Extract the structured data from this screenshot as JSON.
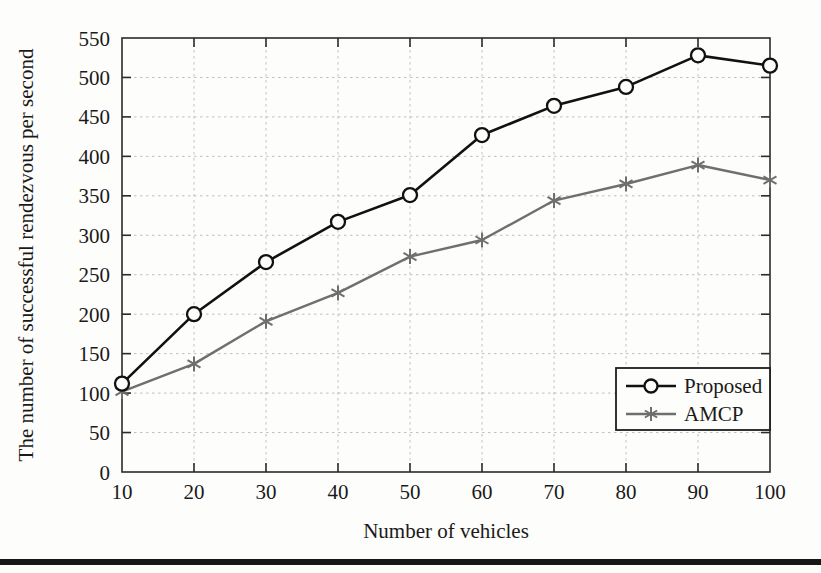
{
  "chart_data": {
    "type": "line",
    "title": "",
    "xlabel": "Number of vehicles",
    "ylabel": "The number of successful rendezvous per second",
    "x": [
      10,
      20,
      30,
      40,
      50,
      60,
      70,
      80,
      90,
      100
    ],
    "xtick_labels": [
      "10",
      "20",
      "30",
      "40",
      "50",
      "60",
      "70",
      "80",
      "90",
      "100"
    ],
    "ytick_labels": [
      "0",
      "50",
      "100",
      "150",
      "200",
      "250",
      "300",
      "350",
      "400",
      "450",
      "500",
      "550"
    ],
    "ytick_values": [
      0,
      50,
      100,
      150,
      200,
      250,
      300,
      350,
      400,
      450,
      500,
      550
    ],
    "xlim": [
      10,
      100
    ],
    "ylim": [
      0,
      550
    ],
    "grid": true,
    "grid_style": "dashed",
    "legend_position": "lower-right-inside",
    "series": [
      {
        "name": "Proposed",
        "marker": "open-circle",
        "color": "#111111",
        "values": [
          112,
          200,
          266,
          317,
          351,
          427,
          464,
          488,
          528,
          515
        ]
      },
      {
        "name": "AMCP",
        "marker": "asterisk",
        "color": "#6f6f6f",
        "values": [
          102,
          137,
          191,
          227,
          273,
          294,
          344,
          365,
          389,
          370
        ]
      }
    ]
  },
  "legend": {
    "entries": [
      {
        "label": "Proposed"
      },
      {
        "label": "AMCP"
      }
    ]
  },
  "axes": {
    "x_title": "Number of vehicles",
    "y_title": "The number of successful rendezvous per second"
  },
  "colors": {
    "proposed": "#111111",
    "amcp": "#6f6f6f",
    "grid": "#b9b9b9",
    "axis": "#2b2b2b",
    "page_background": "#fdfdfb",
    "bottom_rule": "#171717"
  },
  "ticks": {
    "y": [
      "550",
      "500",
      "450",
      "400",
      "350",
      "300",
      "250",
      "200",
      "150",
      "100",
      "50",
      "0"
    ],
    "x": [
      "10",
      "20",
      "30",
      "40",
      "50",
      "60",
      "70",
      "80",
      "90",
      "100"
    ]
  }
}
